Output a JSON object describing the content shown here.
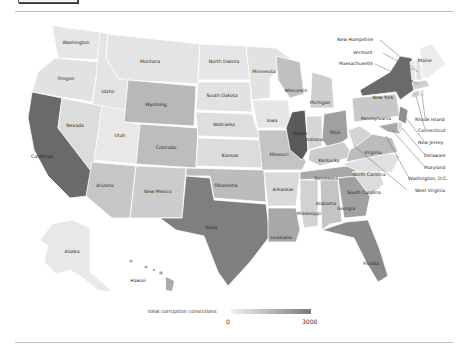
{
  "map": {
    "title": "total corruption convictions",
    "legend": {
      "label": "total corruption convictions",
      "min": "0",
      "max": "3000",
      "color_low": "#f2f2f2",
      "color_high": "#7a7a7a"
    },
    "states": {
      "washington": "Washington",
      "oregon": "Oregon",
      "california": "California",
      "idaho": "Idaho",
      "nevada": "Nevada",
      "utah": "Utah",
      "arizona": "Arizona",
      "montana": "Montana",
      "wyoming": "Wyoming",
      "colorado": "Colorado",
      "new_mexico": "New Mexico",
      "north_dakota": "North Dakota",
      "south_dakota": "South Dakota",
      "nebraska": "Nebraska",
      "kansas": "Kansas",
      "oklahoma": "Oklahoma",
      "texas": "Texas",
      "minnesota": "Minnesota",
      "iowa": "Iowa",
      "missouri": "Missouri",
      "arkansas": "Arkansas",
      "louisiana": "Louisiana",
      "wisconsin": "Wisconsin",
      "illinois": "Illinois",
      "michigan": "Michigan",
      "indiana": "Indiana",
      "ohio": "Ohio",
      "kentucky": "Kentucky",
      "tennessee": "Tennessee",
      "mississippi": "Mississippi",
      "alabama": "Alabama",
      "georgia": "Georgia",
      "florida": "Florida",
      "south_carolina": "South Carolina",
      "north_carolina": "North Carolina",
      "virginia": "Virginia",
      "pennsylvania": "Pennsylvania",
      "new_york": "New York",
      "alaska": "Alaska",
      "hawaii": "Hawaii"
    },
    "callouts": {
      "new_hampshire": "New Hampshire",
      "vermont": "Vermont",
      "massachusetts": "Massachusetts",
      "maine": "Maine",
      "rhode_island": "Rhode Island",
      "connecticut": "Connecticut",
      "new_jersey": "New Jersey",
      "delaware": "Delaware",
      "maryland": "Maryland",
      "washington_dc": "Washington, D.C.",
      "west_virginia": "West Virginia"
    }
  }
}
